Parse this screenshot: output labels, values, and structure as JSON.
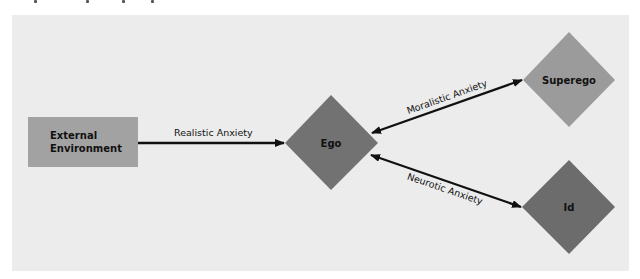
{
  "diagram": {
    "background_color": "#ececec",
    "nodes": [
      {
        "id": "external",
        "label_line1": "External",
        "label_line2": "Environment",
        "shape": "rectangle",
        "color": "#a2a2a2"
      },
      {
        "id": "ego",
        "label": "Ego",
        "shape": "diamond",
        "color": "#727272"
      },
      {
        "id": "superego",
        "label": "Superego",
        "shape": "diamond",
        "color": "#9b9b9b"
      },
      {
        "id": "id",
        "label": "Id",
        "shape": "diamond",
        "color": "#6c6c6c"
      }
    ],
    "edges": [
      {
        "from": "external",
        "to": "ego",
        "label": "Realistic Anxiety",
        "direction": "one-way"
      },
      {
        "from": "ego",
        "to": "superego",
        "label": "Moralistic Anxiety",
        "direction": "two-way"
      },
      {
        "from": "ego",
        "to": "id",
        "label": "Neurotic Anxiety",
        "direction": "two-way"
      }
    ]
  }
}
